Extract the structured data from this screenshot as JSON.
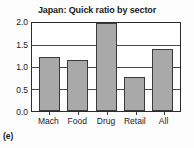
{
  "chart_data": {
    "type": "bar",
    "title": "Japan: Quick ratio by sector",
    "xlabel": "",
    "ylabel": "",
    "categories": [
      "Mach",
      "Food",
      "Drug",
      "Retail",
      "All"
    ],
    "values": [
      1.23,
      1.15,
      2.0,
      0.78,
      1.42
    ],
    "ylim": [
      0.0,
      2.0
    ],
    "yticks": [
      "0.0",
      "0.5",
      "1.0",
      "1.5",
      "2.0"
    ],
    "ytick_values": [
      0.0,
      0.5,
      1.0,
      1.5,
      2.0
    ],
    "grid": true,
    "grid_axis": "y",
    "legend": false,
    "bar_color": "#a9a9a9",
    "bar_edge_color": "#3a3a3a",
    "axis_color": "#2b2b2b"
  },
  "panel": {
    "caption": "(e)"
  }
}
